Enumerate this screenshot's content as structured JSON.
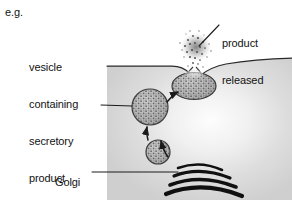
{
  "figure": {
    "kind": "biology-diagram",
    "topic": "exocytosis-secretion",
    "prefix_note": "e.g.",
    "labels": {
      "vesicle": "vesicle\ncontaining\nsecretory\nproduct\ne.g. enzyme",
      "vesicle_lines": [
        "vesicle",
        "containing",
        "secretory",
        "product",
        "e.g. enzyme"
      ],
      "product_released": "product\nreleased",
      "product_released_lines": [
        "product",
        "released"
      ],
      "golgi": "Golgi\nbody",
      "golgi_lines": [
        "Golgi",
        "body"
      ]
    },
    "colors": {
      "background": "#ffffff",
      "cytoplasm": "#d4d4d4",
      "cytoplasm_highlight": "#fbfbfb",
      "membrane_line": "#2a2a2a",
      "vesicle_fill": "#b9b9b9",
      "vesicle_outline": "#3a3a3a",
      "golgi_stack": "#111111",
      "text": "#121212",
      "leader_line": "#1c1c1c",
      "product_cloud": "#7d7d7d"
    },
    "elements": {
      "cell_body": "shaded cytoplasm block with curved plasma membrane at top",
      "vesicle_small": "small stippled vesicle budding from Golgi",
      "vesicle_large": "large stippled secretory vesicle in transit",
      "vesicle_fused": "flattened vesicle fused with plasma membrane",
      "golgi_body": "stack of four curved cisternae",
      "product_cloud": "scattered dots of released product outside the cell",
      "arrows": [
        "Golgi to small vesicle",
        "small vesicle to large vesicle",
        "large vesicle to fusion site"
      ]
    }
  }
}
